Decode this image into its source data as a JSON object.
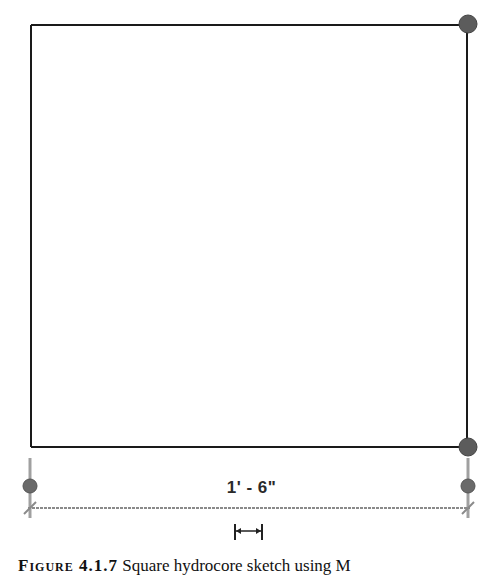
{
  "drawing": {
    "shape": "square",
    "rect": {
      "x1": 31,
      "y1": 25,
      "x2": 466,
      "y2": 447
    },
    "line_color": "#1a1a1a",
    "grip_color": "#5a5a5a",
    "grips": [
      {
        "x": 467,
        "y": 24
      },
      {
        "x": 467,
        "y": 447
      }
    ]
  },
  "dimension": {
    "label": "1' - 6\"",
    "y_line": 481,
    "x_start": 30,
    "x_end": 468,
    "grips": [
      {
        "x": 30,
        "y": 486
      },
      {
        "x": 468,
        "y": 486
      }
    ],
    "line_color": "#8a8a8a",
    "move_handle_icon": "dimension-move-handle"
  },
  "caption": {
    "figure_label": "Figure 4.1.7",
    "text": "Square hydrocore sketch using M"
  }
}
